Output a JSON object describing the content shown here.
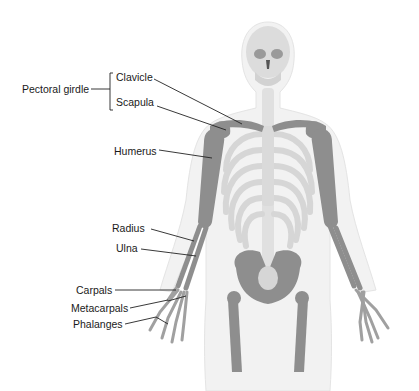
{
  "diagram": {
    "group_label": "Pectoral girdle",
    "labels": {
      "clavicle": "Clavicle",
      "scapula": "Scapula",
      "humerus": "Humerus",
      "radius": "Radius",
      "ulna": "Ulna",
      "carpals": "Carpals",
      "metacarpals": "Metacarpals",
      "phalanges": "Phalanges"
    },
    "colors": {
      "highlight_bone": "#8a8a8a",
      "other_bone": "#d9d9d9",
      "body_outline": "#efefef",
      "leader_line": "#222222"
    }
  }
}
